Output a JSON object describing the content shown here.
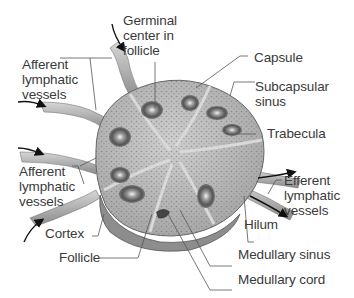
{
  "diagram": {
    "labels": {
      "germinal_center": "Germinal\ncenter in\nfollicle",
      "afferent_top": "Afferent\nlymphatic\nvessels",
      "capsule": "Capsule",
      "subcapsular_sinus": "Subcapsular\nsinus",
      "trabecula": "Trabecula",
      "afferent_bottom": "Afferent\nlymphatic\nvessels",
      "efferent": "Efferent\nlymphatic\nvessels",
      "hilum": "Hilum",
      "cortex": "Cortex",
      "follicle": "Follicle",
      "medullary_sinus": "Medullary sinus",
      "medullary_cord": "Medullary cord"
    },
    "colors": {
      "text": "#3a3a3a",
      "leader": "#555555",
      "node_fill": "#b9b9b9",
      "node_dark": "#7a7a7a",
      "arrow": "#111111"
    }
  }
}
